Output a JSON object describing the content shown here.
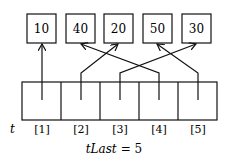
{
  "values": [
    "10",
    "40",
    "20",
    "50",
    "30"
  ],
  "array_label": "t",
  "indices": [
    "[1]",
    "[2]",
    "[3]",
    "[4]",
    "[5]"
  ],
  "caption": "tLast = 5",
  "caption_var": "tLast",
  "caption_eq": "= 5"
}
